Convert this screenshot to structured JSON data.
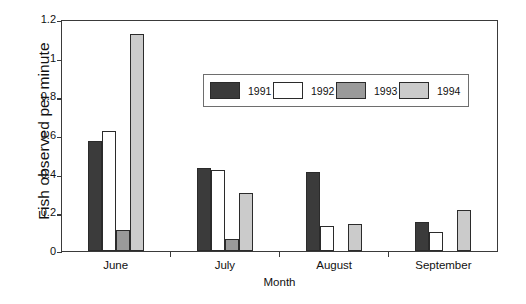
{
  "chart_data": {
    "type": "bar",
    "title": "",
    "xlabel": "Month",
    "ylabel": "Fish observed per minute",
    "categories": [
      "June",
      "July",
      "August",
      "September"
    ],
    "ylim": [
      0,
      1.2
    ],
    "yticks": [
      "0",
      "0.2",
      "0.4",
      "0.6",
      "0.8",
      "1",
      "1.2"
    ],
    "ytick_values": [
      0,
      0.2,
      0.4,
      0.6,
      0.8,
      1.0,
      1.2
    ],
    "grid": false,
    "legend_position": "top-center-inside",
    "series": [
      {
        "name": "1991",
        "color": "#3b3b3b",
        "values": [
          0.57,
          0.43,
          0.41,
          0.15
        ]
      },
      {
        "name": "1992",
        "color": "#ffffff",
        "values": [
          0.62,
          0.42,
          0.13,
          0.1
        ]
      },
      {
        "name": "1993",
        "color": "#9a9a9a",
        "values": [
          0.11,
          0.06,
          0.0,
          0.0
        ]
      },
      {
        "name": "1994",
        "color": "#cbcbcb",
        "values": [
          1.12,
          0.3,
          0.14,
          0.21
        ]
      }
    ]
  },
  "axis": {
    "y_title": "Fish observed per minute",
    "x_title": "Month"
  }
}
